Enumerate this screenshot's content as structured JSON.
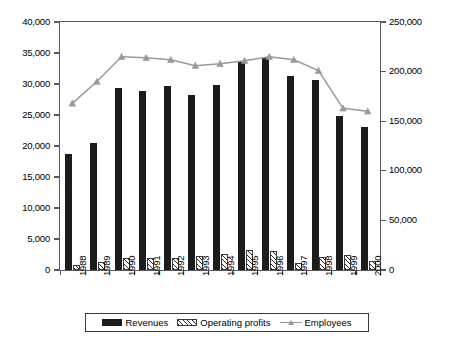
{
  "chart_data": {
    "type": "bar",
    "title": "",
    "xlabel": "",
    "ylabel": "MUSD",
    "ylabel_right": "",
    "categories": [
      "1988",
      "1989",
      "1990",
      "1991",
      "1992",
      "1993",
      "1994",
      "1995",
      "1996",
      "1997",
      "1998",
      "1999",
      "2000"
    ],
    "ylim": [
      0,
      40000
    ],
    "ylim_right": [
      0,
      250000
    ],
    "yticks": [
      "0",
      "5,000",
      "10,000",
      "15,000",
      "20,000",
      "25,000",
      "30,000",
      "35,000",
      "40,000"
    ],
    "yticks_right": [
      "0",
      "50,000",
      "100,000",
      "150,000",
      "200,000",
      "250,000"
    ],
    "grid": false,
    "legend_position": "bottom",
    "series": [
      {
        "name": "Revenues",
        "axis": "left",
        "kind": "bar",
        "color": "#1c1c1c",
        "values": [
          18700,
          20500,
          29300,
          28900,
          29700,
          28300,
          29800,
          33500,
          34300,
          31300,
          30600,
          24800,
          23100
        ]
      },
      {
        "name": "Operating profits",
        "axis": "left",
        "kind": "bar",
        "color": "#2b2b2b",
        "values": [
          800,
          1300,
          1900,
          1950,
          2000,
          2200,
          2550,
          3250,
          3000,
          1200,
          2100,
          2350,
          1450
        ]
      },
      {
        "name": "Employees",
        "axis": "right",
        "kind": "line",
        "color": "#9a9a9a",
        "values": [
          168000,
          190000,
          215000,
          214000,
          212000,
          206000,
          208000,
          211000,
          215000,
          212000,
          201000,
          163000,
          160000
        ]
      }
    ]
  },
  "legend": {
    "items": [
      {
        "label": "Revenues"
      },
      {
        "label": "Operating profits"
      },
      {
        "label": "Employees"
      }
    ]
  }
}
